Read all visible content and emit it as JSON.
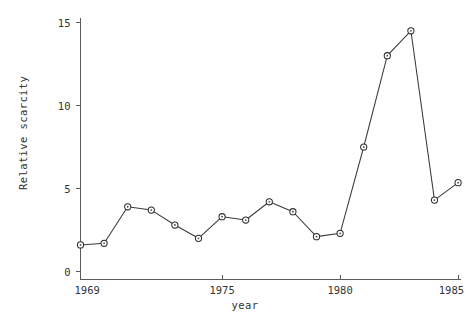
{
  "chart_data": {
    "type": "line",
    "title": "",
    "xlabel": "year",
    "ylabel": "Relative scarcity",
    "x": [
      1969,
      1970,
      1971,
      1972,
      1973,
      1974,
      1975,
      1976,
      1977,
      1978,
      1979,
      1980,
      1981,
      1982,
      1983,
      1984,
      1985
    ],
    "values": [
      1.6,
      1.7,
      3.9,
      3.7,
      2.8,
      2.0,
      3.3,
      3.1,
      4.2,
      3.6,
      2.1,
      2.3,
      7.5,
      13.0,
      14.5,
      4.3,
      5.35
    ],
    "series": [
      {
        "name": "Relative scarcity",
        "values": [
          1.6,
          1.7,
          3.9,
          3.7,
          2.8,
          2.0,
          3.3,
          3.1,
          4.2,
          3.6,
          2.1,
          2.3,
          7.5,
          13.0,
          14.5,
          4.3,
          5.35
        ]
      }
    ],
    "xlim": [
      1969,
      1985
    ],
    "ylim": [
      0,
      15
    ],
    "xticks": [
      1969,
      1975,
      1980,
      1985
    ],
    "xtick_labels": [
      "1969",
      "1975",
      "1980",
      "1985"
    ],
    "yticks": [
      0,
      5,
      10,
      15
    ],
    "ytick_labels": [
      "0",
      "5",
      "10",
      "15"
    ],
    "grid": false,
    "legend": false,
    "marker": "circle-open",
    "line_color": "#3a3a3a",
    "marker_fill": "#ffffff",
    "marker_edge": "#2e2e2e",
    "axis_color": "#5b5b5b",
    "background": "#ffffff"
  },
  "axis": {
    "y_title": "Relative scarcity",
    "x_title": "year",
    "y_labels": [
      "15",
      "10",
      "5",
      "0"
    ],
    "x_labels": [
      "1969",
      "1975",
      "1980",
      "1985"
    ]
  }
}
